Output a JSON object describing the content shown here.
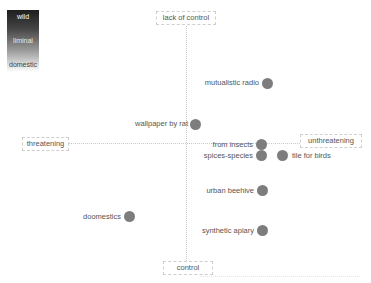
{
  "legend": {
    "gradient": [
      "#1e1e1e",
      "#ffffff"
    ],
    "labels": {
      "top": "wild",
      "middle": "liminal",
      "bottom": "domestic"
    }
  },
  "axes": {
    "top": "lack of control",
    "bottom": "control",
    "left": "threatening",
    "right": "unthreatening"
  },
  "colors": {
    "dot": "#7d7d7d",
    "axis": "#c8c8c8",
    "text": "#555555"
  },
  "items": [
    {
      "label": "mutualistic radio",
      "x": 268,
      "y": 83,
      "label_side": "left"
    },
    {
      "label": "wallpaper by rat",
      "x": 196,
      "y": 124,
      "label_side": "left"
    },
    {
      "label": "from insects",
      "x": 262,
      "y": 145,
      "label_side": "left"
    },
    {
      "label": "spices-species",
      "x": 262,
      "y": 156,
      "label_side": "left"
    },
    {
      "label": "tile for birds",
      "x": 283,
      "y": 156,
      "label_side": "right"
    },
    {
      "label": "urban beehive",
      "x": 263,
      "y": 191,
      "label_side": "left"
    },
    {
      "label": "doomestics",
      "x": 130,
      "y": 217,
      "label_side": "left"
    },
    {
      "label": "synthetic apiary",
      "x": 263,
      "y": 231,
      "label_side": "left"
    }
  ]
}
